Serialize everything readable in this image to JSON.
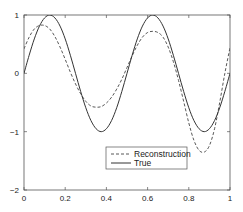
{
  "chart_data": {
    "type": "line",
    "title": "",
    "xlabel": "",
    "ylabel": "",
    "xlim": [
      0,
      1
    ],
    "ylim": [
      -2,
      1
    ],
    "xticks": [
      0,
      0.2,
      0.4,
      0.6,
      0.8,
      1
    ],
    "xtick_labels": [
      "0",
      "0.2",
      "0.4",
      "0.6",
      "0.8",
      "1"
    ],
    "yticks": [
      -2,
      -1,
      0,
      1
    ],
    "ytick_labels": [
      "−2",
      "−1",
      "0",
      "1"
    ],
    "grid": false,
    "legend_position": "lower right (inside)",
    "series": [
      {
        "name": "Reconstruction",
        "style": "dashed",
        "color": "#333333",
        "x": [
          0,
          0.025,
          0.05,
          0.075,
          0.1,
          0.125,
          0.15,
          0.175,
          0.2,
          0.225,
          0.25,
          0.275,
          0.3,
          0.325,
          0.35,
          0.375,
          0.4,
          0.425,
          0.45,
          0.475,
          0.5,
          0.525,
          0.55,
          0.575,
          0.6,
          0.625,
          0.65,
          0.675,
          0.7,
          0.725,
          0.75,
          0.775,
          0.8,
          0.825,
          0.85,
          0.875,
          0.9,
          0.925,
          0.95,
          0.975,
          1
        ],
        "y": [
          0.42,
          0.62,
          0.76,
          0.82,
          0.82,
          0.76,
          0.63,
          0.45,
          0.24,
          0.02,
          -0.18,
          -0.35,
          -0.48,
          -0.56,
          -0.58,
          -0.57,
          -0.51,
          -0.41,
          -0.27,
          -0.1,
          0.1,
          0.3,
          0.48,
          0.62,
          0.7,
          0.72,
          0.7,
          0.62,
          0.45,
          0.2,
          -0.12,
          -0.48,
          -0.85,
          -1.15,
          -1.32,
          -1.35,
          -1.24,
          -0.95,
          -0.5,
          0.0,
          0.44
        ]
      },
      {
        "name": "True",
        "style": "solid",
        "color": "#333333",
        "x": [
          0,
          0.025,
          0.05,
          0.075,
          0.1,
          0.125,
          0.15,
          0.175,
          0.2,
          0.225,
          0.25,
          0.275,
          0.3,
          0.325,
          0.35,
          0.375,
          0.4,
          0.425,
          0.45,
          0.475,
          0.5,
          0.525,
          0.55,
          0.575,
          0.6,
          0.625,
          0.65,
          0.675,
          0.7,
          0.725,
          0.75,
          0.775,
          0.8,
          0.825,
          0.85,
          0.875,
          0.9,
          0.925,
          0.95,
          0.975,
          1
        ],
        "y": [
          0,
          0.31,
          0.59,
          0.81,
          0.95,
          1,
          0.95,
          0.81,
          0.59,
          0.31,
          0,
          -0.31,
          -0.59,
          -0.81,
          -0.95,
          -1,
          -0.95,
          -0.81,
          -0.59,
          -0.31,
          0,
          0.31,
          0.59,
          0.81,
          0.95,
          1,
          0.95,
          0.81,
          0.59,
          0.31,
          0,
          -0.31,
          -0.59,
          -0.81,
          -0.95,
          -1,
          -0.95,
          -0.81,
          -0.59,
          -0.31,
          0
        ]
      }
    ]
  },
  "legend": {
    "items": [
      {
        "label": "Reconstruction",
        "style": "dashed"
      },
      {
        "label": "True",
        "style": "solid"
      }
    ]
  }
}
